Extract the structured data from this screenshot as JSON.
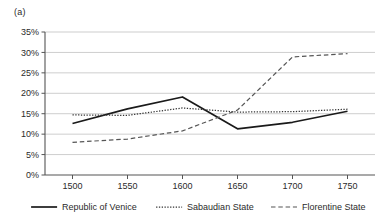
{
  "panel": {
    "label": "(a)"
  },
  "chart_data": {
    "type": "line",
    "title": "",
    "subtitle": "",
    "xlabel": "",
    "ylabel": "",
    "x": [
      1500,
      1550,
      1600,
      1650,
      1700,
      1750
    ],
    "xtick_labels": [
      "1500",
      "1550",
      "1600",
      "1650",
      "1700",
      "1750"
    ],
    "ytick_labels": [
      "0%",
      "5%",
      "10%",
      "15%",
      "20%",
      "25%",
      "30%",
      "35%"
    ],
    "ytick_values": [
      0,
      5,
      10,
      15,
      20,
      25,
      30,
      35
    ],
    "ylim": [
      0,
      35
    ],
    "xlim": [
      1475,
      1775
    ],
    "grid": "horizontal",
    "legend_position": "bottom",
    "series": [
      {
        "name": "Republic of Venice",
        "style": "solid",
        "color": "#1a1a1a",
        "values": [
          12.6,
          16.2,
          19.1,
          11.3,
          12.9,
          15.6
        ]
      },
      {
        "name": "Sabaudian State",
        "style": "dotted",
        "color": "#333333",
        "values": [
          14.7,
          14.6,
          16.4,
          15.4,
          15.5,
          16.1
        ]
      },
      {
        "name": "Florentine State",
        "style": "dashed",
        "color": "#555555",
        "values": [
          8.0,
          8.8,
          10.8,
          15.9,
          28.9,
          29.7
        ]
      }
    ]
  },
  "colors": {
    "axis": "#555555",
    "grid": "#b8b8b8",
    "text": "#2b2b2b",
    "background": "#ffffff"
  }
}
